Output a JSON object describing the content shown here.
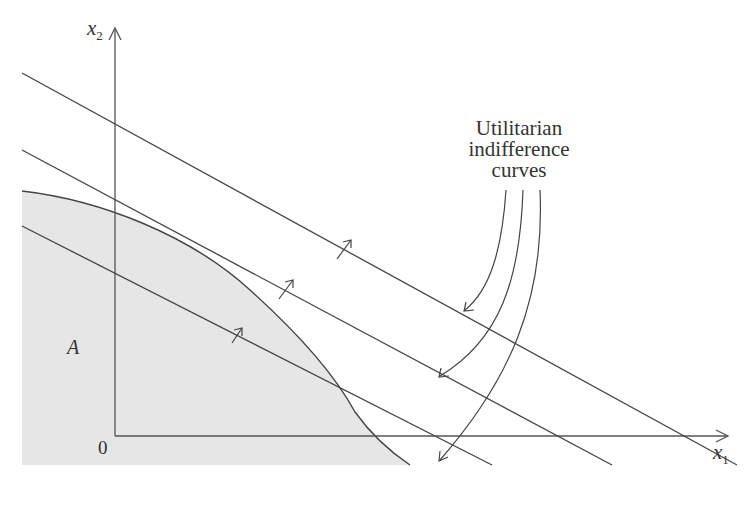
{
  "diagram": {
    "axes": {
      "x_label": {
        "var": "x",
        "sub": "1"
      },
      "y_label": {
        "var": "x",
        "sub": "2"
      },
      "origin_label": "0"
    },
    "region_label": "A",
    "annotation": {
      "line1": "Utilitarian",
      "line2": "indifference",
      "line3": "curves"
    },
    "colors": {
      "stroke": "#444444",
      "region_fill": "#e6e6e6",
      "background": "#ffffff"
    },
    "indifference_lines": [
      {
        "name": "highest",
        "from": [
          22,
          73
        ],
        "to": [
          737,
          465
        ]
      },
      {
        "name": "tangent",
        "from": [
          22,
          150
        ],
        "to": [
          612,
          465
        ]
      },
      {
        "name": "lowest",
        "from": [
          22,
          226
        ],
        "to": [
          492,
          465
        ]
      }
    ]
  }
}
